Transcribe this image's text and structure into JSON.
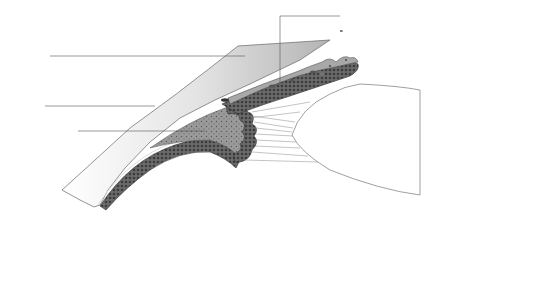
{
  "diagram": {
    "left_labels": [
      {
        "id": "cornea",
        "text": "Cornea"
      },
      {
        "id": "sclera",
        "text": "Sclera"
      },
      {
        "id": "ciliary-muscle",
        "text": "Ciliary muscle"
      }
    ],
    "iris_labels": [
      {
        "id": "dilator-pupillae",
        "text": "Dilator pupillae"
      },
      {
        "id": "sphincter-pupillae",
        "text": "Sphincter pupillae"
      },
      {
        "id": "anterior-limiting-layer",
        "text": "Anterior limiting layer"
      },
      {
        "id": "iris-stroma",
        "text": "Stroma"
      },
      {
        "id": "anterior-epithelial-layer",
        "text": "Anterior epithelial layer"
      },
      {
        "id": "posterior-epithelial-layer",
        "text": "Posterior epithelial layer"
      }
    ],
    "ciliary_labels": [
      {
        "id": "internal-limiting-membrane",
        "text": "Internal limiting membrane"
      },
      {
        "id": "non-pigmented-epithelium",
        "text": "Non-pigmented epithelium"
      },
      {
        "id": "pigmented-epithelium",
        "text": "Pigmented epithelium"
      },
      {
        "id": "ciliary-stroma",
        "text": "Stroma"
      },
      {
        "id": "supraciliary-lamina",
        "text": "Supraciliary lamina"
      }
    ],
    "groups": {
      "iris": "Iris",
      "ciliary_body": "Ciliary body"
    },
    "structure_labels": {
      "lens": "Lens"
    },
    "colors": {
      "line": "#555555",
      "tissue_dark": "#5a5a5a",
      "tissue_mid": "#8c8c8c",
      "tissue_light": "#b8b8b8",
      "cornea_fill": "#d6d6d6",
      "lens_fill": "#ffffff"
    }
  }
}
